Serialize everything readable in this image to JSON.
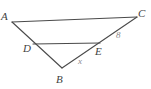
{
  "figure": {
    "type": "geometry-diagram",
    "stroke_color": "#4a4a4a",
    "label_color": "#3f3f3f",
    "measure_color": "#8c8c8c",
    "background_color": "#ffffff",
    "vertices": {
      "A": {
        "label": "A",
        "x": 12,
        "y": 22
      },
      "B": {
        "label": "B",
        "x": 62,
        "y": 68
      },
      "C": {
        "label": "C",
        "x": 137,
        "y": 17
      },
      "D": {
        "label": "D",
        "x": 33,
        "y": 44
      },
      "E": {
        "label": "E",
        "x": 100,
        "y": 43
      }
    },
    "segments": [
      {
        "name": "AC",
        "from": "A",
        "to": "C"
      },
      {
        "name": "AB",
        "from": "A",
        "to": "B"
      },
      {
        "name": "BC",
        "from": "B",
        "to": "C"
      },
      {
        "name": "DE",
        "from": "D",
        "to": "E"
      }
    ],
    "measures": [
      {
        "name": "BE",
        "label": "x",
        "on_segment": "BE"
      },
      {
        "name": "EC",
        "label": "8",
        "on_segment": "EC"
      }
    ]
  }
}
